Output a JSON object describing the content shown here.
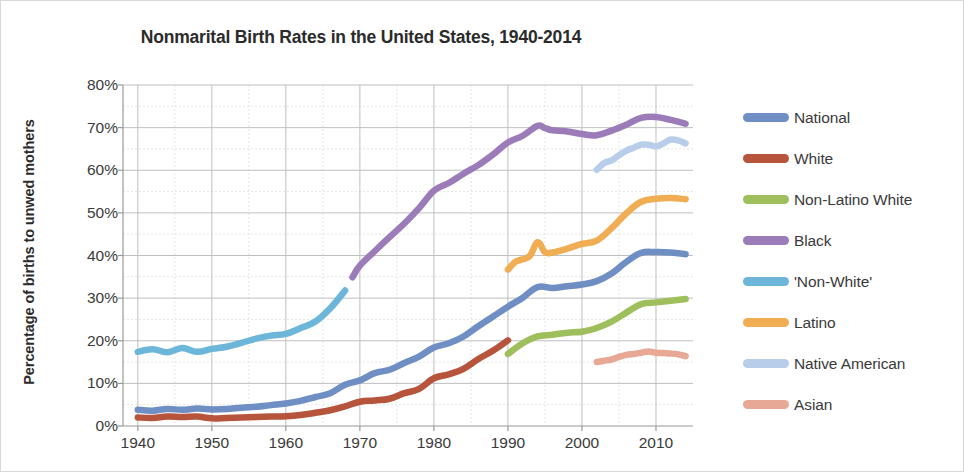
{
  "chart_data": {
    "type": "line",
    "title": "Nonmarital Birth Rates in the United States, 1940-2014",
    "xlabel": "",
    "ylabel": "Percentage of births to unwed mothers",
    "xlim": [
      1938,
      2015
    ],
    "ylim": [
      0,
      80
    ],
    "grid": true,
    "legend_position": "right",
    "y_ticks": [
      "0%",
      "10%",
      "20%",
      "30%",
      "40%",
      "50%",
      "60%",
      "70%",
      "80%"
    ],
    "y_tick_values": [
      0,
      10,
      20,
      30,
      40,
      50,
      60,
      70,
      80
    ],
    "x_ticks": [
      "1940",
      "1950",
      "1960",
      "1970",
      "1980",
      "1990",
      "2000",
      "2010"
    ],
    "x_tick_values": [
      1940,
      1950,
      1960,
      1970,
      1980,
      1990,
      2000,
      2010
    ],
    "series": [
      {
        "name": "National",
        "color": "#6f8fc4",
        "x": [
          1940,
          1942,
          1944,
          1946,
          1948,
          1950,
          1952,
          1954,
          1956,
          1958,
          1960,
          1962,
          1964,
          1966,
          1968,
          1970,
          1972,
          1974,
          1976,
          1978,
          1980,
          1982,
          1984,
          1986,
          1988,
          1990,
          1992,
          1994,
          1996,
          1998,
          2000,
          2002,
          2004,
          2006,
          2008,
          2010,
          2012,
          2014
        ],
        "values": [
          3.8,
          3.6,
          4.0,
          3.8,
          4.1,
          3.9,
          4.0,
          4.3,
          4.5,
          4.9,
          5.3,
          5.9,
          6.8,
          7.7,
          9.7,
          10.7,
          12.4,
          13.2,
          14.8,
          16.3,
          18.4,
          19.4,
          21.0,
          23.4,
          25.7,
          28.0,
          30.1,
          32.6,
          32.4,
          32.8,
          33.2,
          34.0,
          35.8,
          38.5,
          40.6,
          40.8,
          40.7,
          40.3
        ]
      },
      {
        "name": "White",
        "color": "#b6543c",
        "x": [
          1940,
          1942,
          1944,
          1946,
          1948,
          1950,
          1952,
          1954,
          1956,
          1958,
          1960,
          1962,
          1964,
          1966,
          1968,
          1970,
          1972,
          1974,
          1976,
          1978,
          1980,
          1982,
          1984,
          1986,
          1988,
          1990
        ],
        "values": [
          2.0,
          1.9,
          2.2,
          2.1,
          2.2,
          1.8,
          1.9,
          2.0,
          2.1,
          2.2,
          2.3,
          2.6,
          3.1,
          3.7,
          4.6,
          5.7,
          6.0,
          6.4,
          7.7,
          8.7,
          11.2,
          12.1,
          13.4,
          15.7,
          17.7,
          20.1
        ]
      },
      {
        "name": "Non-Latino White",
        "color": "#9fbe5c",
        "x": [
          1990,
          1992,
          1994,
          1996,
          1998,
          2000,
          2002,
          2004,
          2006,
          2008,
          2010,
          2012,
          2014
        ],
        "values": [
          16.9,
          19.4,
          21.0,
          21.4,
          21.9,
          22.1,
          23.0,
          24.5,
          26.6,
          28.6,
          29.0,
          29.4,
          29.8
        ]
      },
      {
        "name": "Black",
        "color": "#9b7cb8",
        "x": [
          1969,
          1970,
          1972,
          1974,
          1976,
          1978,
          1980,
          1982,
          1984,
          1986,
          1988,
          1990,
          1992,
          1994,
          1995,
          1996,
          1998,
          2000,
          2002,
          2004,
          2006,
          2008,
          2010,
          2012,
          2014
        ],
        "values": [
          34.9,
          37.6,
          41.0,
          44.3,
          47.5,
          51.1,
          55.2,
          57.0,
          59.2,
          61.2,
          63.7,
          66.5,
          68.1,
          70.4,
          69.9,
          69.4,
          69.1,
          68.5,
          68.2,
          69.3,
          70.7,
          72.3,
          72.5,
          71.8,
          70.9
        ]
      },
      {
        "name": "'Non-White'",
        "color": "#6cb6d9",
        "x": [
          1940,
          1942,
          1944,
          1946,
          1948,
          1950,
          1952,
          1954,
          1956,
          1958,
          1960,
          1962,
          1964,
          1966,
          1968
        ],
        "values": [
          17.4,
          18.0,
          17.3,
          18.3,
          17.4,
          18.1,
          18.6,
          19.5,
          20.5,
          21.2,
          21.6,
          23.0,
          24.5,
          27.6,
          31.8
        ]
      },
      {
        "name": "Latino",
        "color": "#f0ad53",
        "x": [
          1990,
          1991,
          1992,
          1993,
          1994,
          1995,
          1996,
          1998,
          2000,
          2002,
          2004,
          2006,
          2008,
          2010,
          2012,
          2014
        ],
        "values": [
          36.7,
          38.5,
          39.1,
          40.0,
          43.1,
          40.8,
          40.7,
          41.6,
          42.7,
          43.5,
          46.4,
          49.9,
          52.6,
          53.3,
          53.5,
          53.2
        ]
      },
      {
        "name": "Native American",
        "color": "#b8cdea",
        "x": [
          2002,
          2003,
          2004,
          2005,
          2006,
          2007,
          2008,
          2009,
          2010,
          2011,
          2012,
          2013,
          2014
        ],
        "values": [
          60.1,
          61.7,
          62.3,
          63.5,
          64.6,
          65.3,
          66.0,
          66.0,
          65.6,
          66.3,
          67.2,
          67.0,
          66.3
        ]
      },
      {
        "name": "Asian",
        "color": "#e8a896",
        "x": [
          2002,
          2003,
          2004,
          2005,
          2006,
          2007,
          2008,
          2009,
          2010,
          2011,
          2012,
          2013,
          2014
        ],
        "values": [
          15.0,
          15.3,
          15.6,
          16.2,
          16.7,
          16.9,
          17.2,
          17.5,
          17.2,
          17.1,
          17.0,
          16.8,
          16.4
        ]
      }
    ]
  }
}
